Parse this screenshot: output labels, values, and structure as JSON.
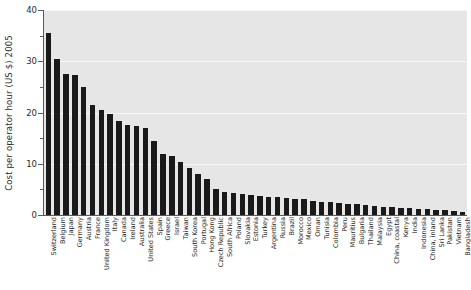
{
  "chart_data": {
    "type": "bar",
    "title": "",
    "subtitle": "",
    "xlabel": "",
    "ylabel": "Cost per operator hour (US $) 2005",
    "ylim": [
      0,
      40
    ],
    "y_ticks": [
      0,
      10,
      20,
      30,
      40
    ],
    "y_minor_ticks": [
      5,
      15,
      25,
      35
    ],
    "grid": true,
    "grid_axis": "y",
    "legend": "none",
    "bar_color": "#1a1a1a",
    "plot_background": "#e6e6e6",
    "gridline_color": "#f7f7f7",
    "axis_color": "#5a5a5a",
    "categories": [
      "Switzerland",
      "Belgium",
      "Japan",
      "Germany",
      "Austria",
      "France",
      "United Kingdom",
      "Italy",
      "Canada",
      "Ireland",
      "Australia",
      "United States",
      "Spain",
      "Greece",
      "Israel",
      "Taiwan",
      "South Korea",
      "Portugal",
      "Hong Kong",
      "Czech Republic",
      "South Africa",
      "Poland",
      "Slovakia",
      "Estonia",
      "Turkey",
      "Argentina",
      "Russia",
      "Brazil",
      "Morocco",
      "Mexico",
      "Oman",
      "Tunisia",
      "Colombia",
      "Peru",
      "Mauritius",
      "Bulgaria",
      "Thailand",
      "Malaysia",
      "Egypt",
      "China, coastal",
      "Kenya",
      "India",
      "Indonesia",
      "China, inland",
      "Sri Lanka",
      "Pakistan",
      "Vietnam",
      "Bangladesh"
    ],
    "values": [
      35.6,
      30.5,
      27.5,
      27.4,
      25.0,
      21.4,
      20.4,
      19.8,
      18.3,
      17.6,
      17.4,
      16.9,
      14.5,
      12.0,
      11.6,
      10.4,
      9.2,
      8.0,
      7.0,
      5.0,
      4.5,
      4.3,
      4.1,
      3.9,
      3.8,
      3.6,
      3.5,
      3.4,
      3.2,
      3.1,
      2.8,
      2.6,
      2.5,
      2.4,
      2.2,
      2.1,
      1.9,
      1.8,
      1.6,
      1.5,
      1.4,
      1.3,
      1.2,
      1.1,
      1.0,
      0.9,
      0.8,
      0.6
    ],
    "value_unit": "US $ per operator hour",
    "value_year": "2005"
  }
}
